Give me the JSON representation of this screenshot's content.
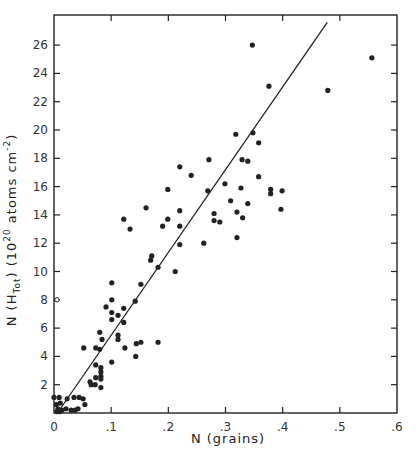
{
  "chart_data": {
    "type": "scatter",
    "title": "",
    "xlabel": "N (grains)",
    "ylabel": "N (H_Tot) (10^20 atoms cm^-2)",
    "ylabel_parts": {
      "pre": "N (H",
      "sub": "Tot",
      "mid": ") (10",
      "sup": "20",
      "post": " atoms cm",
      "sup2": "-2",
      "end": ")"
    },
    "xlim": [
      0,
      0.6
    ],
    "ylim": [
      0,
      28
    ],
    "x_ticks": [
      0,
      0.1,
      0.2,
      0.3,
      0.4,
      0.5,
      0.6
    ],
    "x_tick_labels": [
      "0",
      ".1",
      ".2",
      ".3",
      ".4",
      ".5",
      ".6"
    ],
    "y_ticks": [
      2,
      4,
      6,
      8,
      10,
      12,
      14,
      16,
      18,
      20,
      22,
      24,
      26
    ],
    "y_tick_labels": [
      "2",
      "4",
      "6",
      "8",
      "10",
      "12",
      "14",
      "16",
      "18",
      "20",
      "22",
      "24",
      "26"
    ],
    "grid": false,
    "legend": null,
    "fit_line": {
      "x": [
        0.006,
        0.478
      ],
      "y": [
        0,
        27.6
      ]
    },
    "open_markers": [
      {
        "x": 0.0,
        "y": 8.0
      }
    ],
    "series": [
      {
        "name": "data",
        "marker": "filled-circle",
        "points": [
          [
            0.347,
            26.0
          ],
          [
            0.556,
            25.1
          ],
          [
            0.376,
            23.1
          ],
          [
            0.479,
            22.8
          ],
          [
            0.318,
            19.7
          ],
          [
            0.348,
            19.8
          ],
          [
            0.358,
            19.1
          ],
          [
            0.271,
            17.9
          ],
          [
            0.329,
            17.9
          ],
          [
            0.339,
            17.8
          ],
          [
            0.22,
            17.4
          ],
          [
            0.24,
            16.8
          ],
          [
            0.358,
            16.7
          ],
          [
            0.299,
            16.2
          ],
          [
            0.327,
            15.9
          ],
          [
            0.199,
            15.8
          ],
          [
            0.269,
            15.7
          ],
          [
            0.379,
            15.8
          ],
          [
            0.379,
            15.5
          ],
          [
            0.399,
            15.7
          ],
          [
            0.309,
            15.0
          ],
          [
            0.339,
            14.8
          ],
          [
            0.161,
            14.5
          ],
          [
            0.397,
            14.4
          ],
          [
            0.22,
            14.3
          ],
          [
            0.32,
            14.2
          ],
          [
            0.28,
            14.1
          ],
          [
            0.33,
            13.8
          ],
          [
            0.199,
            13.7
          ],
          [
            0.122,
            13.7
          ],
          [
            0.28,
            13.6
          ],
          [
            0.29,
            13.5
          ],
          [
            0.19,
            13.2
          ],
          [
            0.22,
            13.2
          ],
          [
            0.133,
            13.0
          ],
          [
            0.32,
            12.4
          ],
          [
            0.262,
            12.0
          ],
          [
            0.22,
            11.9
          ],
          [
            0.171,
            11.1
          ],
          [
            0.169,
            10.8
          ],
          [
            0.182,
            10.3
          ],
          [
            0.212,
            10.0
          ],
          [
            0.101,
            9.2
          ],
          [
            0.152,
            9.1
          ],
          [
            0.101,
            8.0
          ],
          [
            0.142,
            7.9
          ],
          [
            0.091,
            7.5
          ],
          [
            0.122,
            7.4
          ],
          [
            0.101,
            7.1
          ],
          [
            0.112,
            6.9
          ],
          [
            0.101,
            6.6
          ],
          [
            0.122,
            6.4
          ],
          [
            0.08,
            5.7
          ],
          [
            0.112,
            5.5
          ],
          [
            0.084,
            5.2
          ],
          [
            0.112,
            5.2
          ],
          [
            0.152,
            5.0
          ],
          [
            0.182,
            5.0
          ],
          [
            0.144,
            4.9
          ],
          [
            0.052,
            4.6
          ],
          [
            0.073,
            4.6
          ],
          [
            0.124,
            4.6
          ],
          [
            0.08,
            4.5
          ],
          [
            0.143,
            4.0
          ],
          [
            0.101,
            3.6
          ],
          [
            0.073,
            3.4
          ],
          [
            0.082,
            3.2
          ],
          [
            0.082,
            2.9
          ],
          [
            0.082,
            2.6
          ],
          [
            0.073,
            2.5
          ],
          [
            0.082,
            2.4
          ],
          [
            0.063,
            2.2
          ],
          [
            0.072,
            2.0
          ],
          [
            0.065,
            2.0
          ],
          [
            0.082,
            1.8
          ],
          [
            0.035,
            1.1
          ],
          [
            0.044,
            1.1
          ],
          [
            0.051,
            1.0
          ],
          [
            0.023,
            1.0
          ],
          [
            0.054,
            0.6
          ],
          [
            0.0,
            1.1
          ],
          [
            0.009,
            1.1
          ],
          [
            0.011,
            0.7
          ],
          [
            0.004,
            0.6
          ],
          [
            0.007,
            0.3
          ],
          [
            0.014,
            0.2
          ],
          [
            0.021,
            0.3
          ],
          [
            0.03,
            0.2
          ],
          [
            0.037,
            0.2
          ],
          [
            0.042,
            0.3
          ],
          [
            0.005,
            0.1
          ],
          [
            0.01,
            0.1
          ]
        ]
      }
    ]
  },
  "colors": {
    "ink": "#222222",
    "background": "#ffffff"
  }
}
